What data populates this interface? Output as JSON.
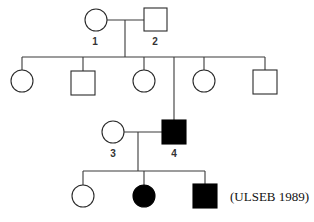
{
  "diagram": {
    "type": "pedigree",
    "citation": "(ULSEB 1989)",
    "colors": {
      "affected": "#000000",
      "unaffected": "#ffffff",
      "line": "#3a3a3a"
    },
    "individuals": [
      {
        "id": "1",
        "label": "1",
        "sex": "female",
        "affected": false,
        "generation": 1
      },
      {
        "id": "2",
        "label": "2",
        "sex": "male",
        "affected": false,
        "generation": 1
      },
      {
        "id": "g2-1",
        "label": "",
        "sex": "female",
        "affected": false,
        "generation": 2
      },
      {
        "id": "g2-2",
        "label": "",
        "sex": "male",
        "affected": false,
        "generation": 2
      },
      {
        "id": "g2-3",
        "label": "",
        "sex": "female",
        "affected": false,
        "generation": 2
      },
      {
        "id": "4",
        "label": "4",
        "sex": "male",
        "affected": true,
        "generation": 2
      },
      {
        "id": "g2-5",
        "label": "",
        "sex": "female",
        "affected": false,
        "generation": 2
      },
      {
        "id": "g2-6",
        "label": "",
        "sex": "male",
        "affected": false,
        "generation": 2
      },
      {
        "id": "3",
        "label": "3",
        "sex": "female",
        "affected": false,
        "generation": 2,
        "note": "married in"
      },
      {
        "id": "g3-1",
        "label": "",
        "sex": "female",
        "affected": false,
        "generation": 3
      },
      {
        "id": "g3-2",
        "label": "",
        "sex": "female",
        "affected": true,
        "generation": 3
      },
      {
        "id": "g3-3",
        "label": "",
        "sex": "male",
        "affected": true,
        "generation": 3
      }
    ],
    "matings": [
      {
        "partners": [
          "1",
          "2"
        ],
        "children": [
          "g2-1",
          "g2-2",
          "g2-3",
          "4",
          "g2-5",
          "g2-6"
        ]
      },
      {
        "partners": [
          "3",
          "4"
        ],
        "children": [
          "g3-1",
          "g3-2",
          "g3-3"
        ]
      }
    ],
    "legend": {
      "circle": "female",
      "square": "male",
      "filled": "affected",
      "open": "unaffected"
    }
  }
}
